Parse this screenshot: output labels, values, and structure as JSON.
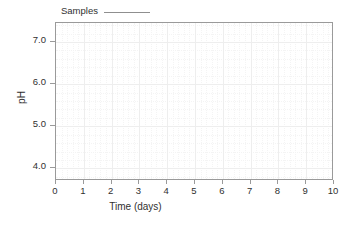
{
  "chart_data": {
    "type": "line",
    "title": "",
    "xlabel": "Time (days)",
    "ylabel": "pH",
    "xlim": [
      0,
      10
    ],
    "ylim": [
      3.7,
      7.45
    ],
    "grid": true,
    "legend_position": "top-left-outside",
    "xticks": [
      {
        "label": "0",
        "value": 0
      },
      {
        "label": "1",
        "value": 1
      },
      {
        "label": "2",
        "value": 2
      },
      {
        "label": "3",
        "value": 3
      },
      {
        "label": "4",
        "value": 4
      },
      {
        "label": "5",
        "value": 5
      },
      {
        "label": "6",
        "value": 6
      },
      {
        "label": "7",
        "value": 7
      },
      {
        "label": "8",
        "value": 8
      },
      {
        "label": "9",
        "value": 9
      },
      {
        "label": "10",
        "value": 10
      }
    ],
    "yticks": [
      {
        "label": "7.0",
        "value": 7.0
      },
      {
        "label": "6.0",
        "value": 6.0
      },
      {
        "label": "5.0",
        "value": 5.0
      },
      {
        "label": "4.0",
        "value": 4.0
      }
    ],
    "series": [
      {
        "name": "Samples",
        "x": [],
        "values": [],
        "color": "#8f8f8f",
        "style": "solid-line"
      }
    ]
  },
  "legend": {
    "entries": [
      {
        "label": "Samples",
        "color": "#8f8f8f"
      }
    ]
  },
  "colors": {
    "frame": "#9a9a9a",
    "grid_major": "#eeeeee",
    "grid_minor": "#f4f4f4",
    "text": "#303030",
    "background": "#ffffff"
  }
}
